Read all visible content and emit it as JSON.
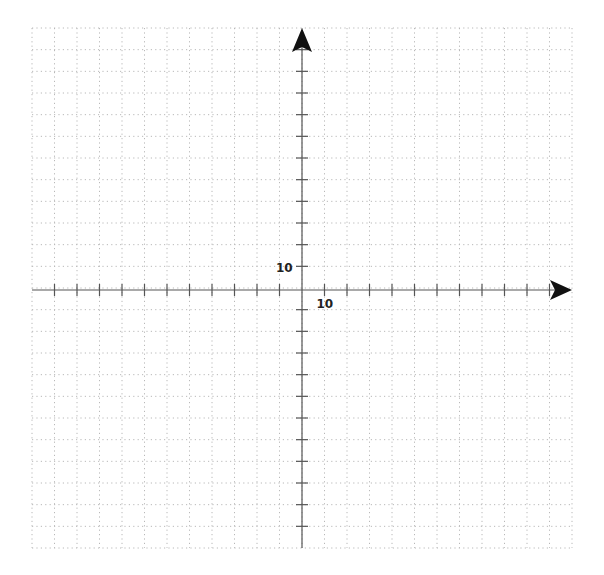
{
  "diagram": {
    "type": "coordinate-plane",
    "grid": {
      "columns": 24,
      "rows": 24,
      "left": 32,
      "top": 28,
      "right": 572,
      "bottom": 548,
      "line_color": "#b8b8b8",
      "style": "dotted"
    },
    "axes": {
      "origin_px": [
        302,
        290
      ],
      "color": "#555555",
      "arrow_color": "#111111",
      "x_arrow": "right",
      "y_arrow": "up",
      "tick_interval_units": 10,
      "x_tick_label": "10",
      "y_tick_label": "10"
    }
  }
}
